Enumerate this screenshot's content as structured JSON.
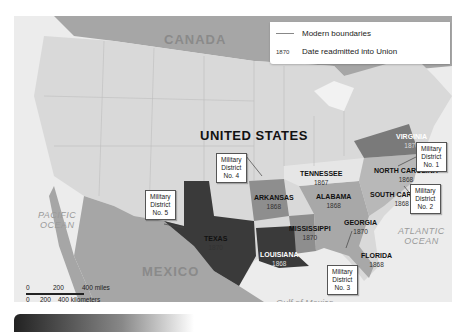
{
  "legend": {
    "boundaries_label": "Modern boundaries",
    "year_sample": "1870",
    "year_label": "Date readmitted into Union"
  },
  "countries": {
    "canada": "CANADA",
    "us": "UNITED STATES",
    "mexico": "MEXICO"
  },
  "water": {
    "pacific": [
      "PACIFIC",
      "OCEAN"
    ],
    "atlantic": [
      "ATLANTIC",
      "OCEAN"
    ],
    "gulf": "Gulf of Mexico"
  },
  "states": [
    {
      "name": "VIRGINIA",
      "year": "1870"
    },
    {
      "name": "NORTH CAROLINA",
      "year": "1868"
    },
    {
      "name": "SOUTH CAROLINA",
      "year": "1868"
    },
    {
      "name": "TENNESSEE",
      "year": "1867"
    },
    {
      "name": "ARKANSAS",
      "year": "1868"
    },
    {
      "name": "ALABAMA",
      "year": "1868"
    },
    {
      "name": "MISSISSIPPI",
      "year": "1870"
    },
    {
      "name": "GEORGIA",
      "year": "1870"
    },
    {
      "name": "FLORIDA",
      "year": "1868"
    },
    {
      "name": "TEXAS",
      "year": "1870"
    },
    {
      "name": "LOUISIANA",
      "year": "1868"
    }
  ],
  "districts": [
    {
      "line1": "Military",
      "line2": "District",
      "line3": "No. 1"
    },
    {
      "line1": "Military",
      "line2": "District",
      "line3": "No. 2"
    },
    {
      "line1": "Military",
      "line2": "District",
      "line3": "No. 3"
    },
    {
      "line1": "Military",
      "line2": "District",
      "line3": "No. 4"
    },
    {
      "line1": "Military",
      "line2": "District",
      "line3": "No. 5"
    }
  ],
  "scale": {
    "miles": [
      "0",
      "200",
      "400 miles"
    ],
    "km": [
      "0",
      "200",
      "400 kilometers"
    ]
  },
  "colors": {
    "land_us": "#d9d9d9",
    "land_foreign": "#a6a6a6",
    "water": "#ececec",
    "district1": "#7a7a7a",
    "district2": "#b8b8b8",
    "district3": "#a8a8a8",
    "district4": "#8e8e8e",
    "district5": "#3a3a3a"
  }
}
